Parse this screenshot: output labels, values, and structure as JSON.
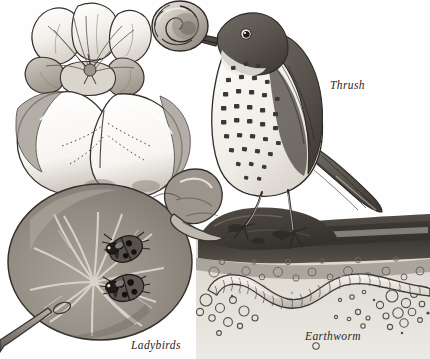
{
  "illustration": {
    "kind": "vintage-natural-history-plate",
    "medium": "pen-and-ink-with-grey-wash",
    "background_color": "#fefefe",
    "ink_color": "#2a2724",
    "labels": [
      {
        "id": "thrush",
        "text": "Thrush",
        "x": 330,
        "y": 79,
        "style": "italic-serif"
      },
      {
        "id": "ladybirds",
        "text": "Ladybirds",
        "x": 131,
        "y": 339,
        "style": "italic-serif"
      },
      {
        "id": "earthworm",
        "text": "Earthworm",
        "x": 305,
        "y": 330,
        "style": "italic-serif"
      }
    ],
    "subjects": [
      {
        "name": "song-thrush",
        "common_name": "Thrush",
        "description": "Perched bird in right profile, speckled breast, holding a snail shell in its beak, standing on a soil mound",
        "region": {
          "x": 190,
          "y": 0,
          "width": 240,
          "height": 230
        },
        "plumage": {
          "back": "#5f5b56",
          "breast": "#f2efe9",
          "spots": "#3b3733"
        }
      },
      {
        "name": "snail",
        "common_name": "Snail",
        "description": "Spiral-shelled snail gripped in the thrush's beak",
        "region": {
          "x": 150,
          "y": 2,
          "width": 60,
          "height": 50
        },
        "shell_color": "#cfcac2"
      },
      {
        "name": "ladybirds",
        "common_name": "Ladybirds",
        "description": "Two spotted beetles resting on the upper surface of a nasturtium leaf",
        "count": 2,
        "region": {
          "x": 100,
          "y": 228,
          "width": 70,
          "height": 78
        },
        "body_color": "#3a3531",
        "spot_count_each": 4
      },
      {
        "name": "earthworm",
        "common_name": "Earthworm",
        "description": "Segmented worm winding through a cutaway of the soil beneath the surface",
        "region": {
          "x": 205,
          "y": 270,
          "width": 220,
          "height": 60
        },
        "body_color": "#e8e3da"
      },
      {
        "name": "nasturtium-plant",
        "common_name": "Nasturtium",
        "description": "Flower with five rounded petals above a large round peltate leaf with radiating veins, on a curving stem",
        "region": {
          "x": 0,
          "y": 0,
          "width": 215,
          "height": 359
        },
        "leaf_color": "#9a948c",
        "petal_color": "#f6f4ef"
      },
      {
        "name": "soil-cross-section",
        "common_name": "Soil",
        "description": "Dark topsoil band over pale subsoil scattered with pebbles and air pockets",
        "region": {
          "x": 195,
          "y": 205,
          "width": 235,
          "height": 154
        },
        "topsoil_color": "#4a4540",
        "subsoil_color": "#cfcac2"
      }
    ]
  }
}
